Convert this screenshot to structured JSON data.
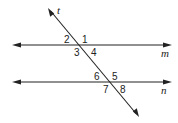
{
  "diagram": {
    "type": "parallel lines cut by a transversal",
    "lines": {
      "transversal": "t",
      "parallel_top": "m",
      "parallel_bottom": "n"
    },
    "angles": [
      "1",
      "2",
      "3",
      "4",
      "5",
      "6",
      "7",
      "8"
    ],
    "colors": {
      "stroke": "#222222",
      "background": "#ffffff"
    }
  }
}
